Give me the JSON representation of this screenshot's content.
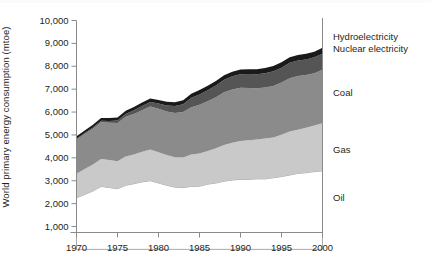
{
  "chart_data": {
    "type": "area",
    "title": "",
    "subtitle": "",
    "xlabel": "",
    "ylabel": "World primary energy consumption (mtoe)",
    "xlim": [
      1970,
      2000
    ],
    "ylim": [
      0,
      10000
    ],
    "grid": false,
    "stacked": true,
    "legend_position": "right-inline",
    "x": [
      1970,
      1971,
      1972,
      1973,
      1974,
      1975,
      1976,
      1977,
      1978,
      1979,
      1980,
      1981,
      1982,
      1983,
      1984,
      1985,
      1986,
      1987,
      1988,
      1989,
      1990,
      1991,
      1992,
      1993,
      1994,
      1995,
      1996,
      1997,
      1998,
      1999,
      2000
    ],
    "xticks": [
      1970,
      1975,
      1980,
      1985,
      1990,
      1995,
      2000
    ],
    "xtick_labels": [
      "1970",
      "1975",
      "1980",
      "1985",
      "1990",
      "1995",
      "2000"
    ],
    "yticks": [
      1000,
      2000,
      3000,
      4000,
      5000,
      6000,
      7000,
      8000,
      9000,
      10000
    ],
    "ytick_labels": [
      "1,000",
      "2,000",
      "3,000",
      "4,000",
      "5,000",
      "6,000",
      "7,000",
      "8,000",
      "9,000",
      "10,000"
    ],
    "series": [
      {
        "name": "Oil",
        "color": "#ffffff",
        "values": [
          2250,
          2400,
          2550,
          2750,
          2700,
          2650,
          2800,
          2870,
          2950,
          3000,
          2900,
          2800,
          2720,
          2700,
          2750,
          2760,
          2850,
          2900,
          2980,
          3030,
          3060,
          3060,
          3080,
          3080,
          3130,
          3180,
          3250,
          3320,
          3350,
          3400,
          3430
        ]
      },
      {
        "name": "Gas",
        "color": "#c9c9c9",
        "values": [
          1050,
          1110,
          1160,
          1200,
          1210,
          1200,
          1260,
          1280,
          1320,
          1360,
          1340,
          1320,
          1310,
          1320,
          1400,
          1430,
          1450,
          1520,
          1580,
          1630,
          1680,
          1710,
          1720,
          1760,
          1760,
          1830,
          1900,
          1910,
          1960,
          2010,
          2080
        ]
      },
      {
        "name": "Coal",
        "color": "#8b8b8b",
        "values": [
          1500,
          1530,
          1560,
          1610,
          1620,
          1670,
          1730,
          1770,
          1810,
          1880,
          1900,
          1900,
          1930,
          1980,
          2060,
          2130,
          2170,
          2230,
          2300,
          2330,
          2320,
          2280,
          2240,
          2230,
          2250,
          2280,
          2330,
          2350,
          2310,
          2290,
          2340
        ]
      },
      {
        "name": "Nuclear electricity",
        "color": "#555555",
        "values": [
          30,
          40,
          50,
          60,
          80,
          110,
          130,
          160,
          190,
          200,
          230,
          270,
          300,
          340,
          410,
          450,
          480,
          510,
          550,
          570,
          590,
          610,
          610,
          630,
          640,
          650,
          670,
          670,
          680,
          690,
          700
        ]
      },
      {
        "name": "Hydroelectricity",
        "color": "#1a1a1a",
        "values": [
          110,
          115,
          120,
          120,
          130,
          135,
          135,
          145,
          150,
          155,
          160,
          165,
          170,
          180,
          185,
          190,
          195,
          195,
          200,
          200,
          210,
          215,
          215,
          225,
          230,
          235,
          240,
          240,
          245,
          250,
          255
        ]
      }
    ],
    "annotations": [
      {
        "text": "Hydroelectricity",
        "target": "Hydroelectricity"
      },
      {
        "text": "Nuclear electricity",
        "target": "Nuclear electricity"
      },
      {
        "text": "Coal",
        "target": "Coal"
      },
      {
        "text": "Gas",
        "target": "Gas"
      },
      {
        "text": "Oil",
        "target": "Oil"
      }
    ]
  },
  "axis": {
    "y_axis_title": "World primary energy consumption (mtoe)"
  },
  "legend": {
    "hydro": "Hydroelectricity",
    "nuclear": "Nuclear electricity",
    "coal": "Coal",
    "gas": "Gas",
    "oil": "Oil"
  }
}
